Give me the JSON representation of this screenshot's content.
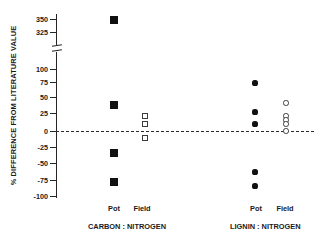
{
  "top_caption": "",
  "chart_data": {
    "type": "scatter",
    "title": "",
    "xlabel": "",
    "ylabel": "% DIFFERENCE FROM LITERATURE VALUE",
    "axis_break": {
      "present": true,
      "below": 100,
      "above": 325
    },
    "yticks_upper": [
      350,
      325
    ],
    "yticks_lower": [
      100,
      75,
      50,
      25,
      0,
      -25,
      -50,
      -75,
      -100
    ],
    "ylim_lower": [
      -100,
      100
    ],
    "ylim_upper": [
      325,
      350
    ],
    "zero_reference_line": 0,
    "grid": false,
    "legend_position": "none",
    "group_labels": [
      "CARBON : NITROGEN",
      "LIGNIN : NITROGEN"
    ],
    "category_labels": [
      "Pot",
      "Field",
      "Pot",
      "Field"
    ],
    "series": [
      {
        "name": "Carbon : Nitrogen - Pot",
        "marker": "filled-square",
        "values": [
          347,
          39,
          -35,
          -78
        ]
      },
      {
        "name": "Carbon : Nitrogen - Field",
        "marker": "open-square",
        "values": [
          20,
          12,
          -9
        ]
      },
      {
        "name": "Lignin : Nitrogen - Pot",
        "marker": "filled-circle",
        "values": [
          74,
          29,
          10,
          -66,
          -87
        ]
      },
      {
        "name": "Lignin : Nitrogen - Field",
        "marker": "open-circle",
        "values": [
          43,
          22,
          18,
          14,
          1
        ]
      }
    ]
  },
  "axis": {
    "ticks": [
      {
        "label": "350",
        "y": 19
      },
      {
        "label": "325",
        "y": 32
      },
      {
        "label": "100",
        "y": 69
      },
      {
        "label": "75",
        "y": 82
      },
      {
        "label": "50",
        "y": 97
      },
      {
        "label": "25",
        "y": 113
      },
      {
        "label": "0",
        "y": 131
      },
      {
        "label": "-25",
        "y": 147
      },
      {
        "label": "-50",
        "y": 163
      },
      {
        "label": "-75",
        "y": 180
      },
      {
        "label": "-100",
        "y": 196
      }
    ]
  },
  "xaxis": {
    "categories": [
      {
        "label": "Pot",
        "x": 100
      },
      {
        "label": "Field",
        "x": 128
      },
      {
        "label": "Pot",
        "x": 242
      },
      {
        "label": "Field",
        "x": 271
      }
    ],
    "groups": [
      {
        "label": "CARBON : NITROGEN",
        "x": 88
      },
      {
        "label": "LIGNIN : NITROGEN",
        "x": 230
      }
    ]
  },
  "points": {
    "carbon_pot": [
      {
        "x": 113,
        "y": 19
      },
      {
        "x": 113,
        "y": 104
      },
      {
        "x": 113,
        "y": 152
      },
      {
        "x": 113,
        "y": 181
      }
    ],
    "carbon_field": [
      {
        "x": 145,
        "y": 116
      },
      {
        "x": 145,
        "y": 124
      },
      {
        "x": 145,
        "y": 138
      }
    ],
    "lignin_pot": [
      {
        "x": 255,
        "y": 83
      },
      {
        "x": 255,
        "y": 112
      },
      {
        "x": 255,
        "y": 124
      },
      {
        "x": 255,
        "y": 172
      },
      {
        "x": 255,
        "y": 186
      }
    ],
    "lignin_field": [
      {
        "x": 286,
        "y": 103
      },
      {
        "x": 286,
        "y": 116
      },
      {
        "x": 286,
        "y": 120
      },
      {
        "x": 286,
        "y": 124
      },
      {
        "x": 286,
        "y": 131
      }
    ]
  }
}
